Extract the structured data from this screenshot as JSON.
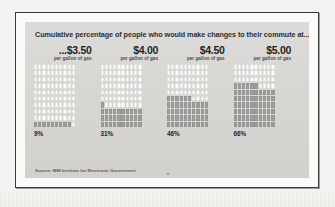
{
  "figure": {
    "headline": "Cumulative percentage of people who would make changes to their commute at...",
    "source": "Source: IBM Institute for Electronic Government",
    "per_gallon_label": "per gallon of gas"
  },
  "colors": {
    "panel_background": "#d9d8d6",
    "frame_border": "#3b3b3b",
    "cell_empty": "#fdfdfc",
    "cell_filled": "#9d9d9b",
    "headline_text": "#2e2e2e",
    "price_text": "#1f1f1f"
  },
  "chart_data": {
    "type": "bar",
    "title": "Cumulative percentage of people who would make changes to their commute at...",
    "subtitle": "per gallon of gas",
    "xlabel": "",
    "ylabel": "",
    "ylim": [
      0,
      100
    ],
    "grid": true,
    "legend": "none",
    "units": "percent",
    "waffle": {
      "rows": 10,
      "columns": 10,
      "cell_value": 1
    },
    "categories": [
      "...$3.50",
      "$4.00",
      "$4.50",
      "$5.00"
    ],
    "values": [
      9,
      31,
      46,
      66
    ],
    "value_labels": [
      "9%",
      "31%",
      "46%",
      "66%"
    ],
    "series": [
      {
        "name": "Cumulative percentage of people who would make changes to their commute",
        "values": [
          9,
          31,
          46,
          66
        ]
      }
    ],
    "points": [
      {
        "price": "...$3.50",
        "sublabel": "per gallon of gas",
        "percent": 9,
        "label": "9%"
      },
      {
        "price": "$4.00",
        "sublabel": "per gallon of gas",
        "percent": 31,
        "label": "31%"
      },
      {
        "price": "$4.50",
        "sublabel": "per gallon of gas",
        "percent": 46,
        "label": "46%"
      },
      {
        "price": "$5.00",
        "sublabel": "per gallon of gas",
        "percent": 66,
        "label": "66%"
      }
    ]
  }
}
